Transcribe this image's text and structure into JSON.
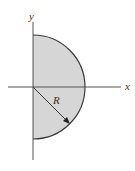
{
  "figure": {
    "labels": {
      "x_axis": "x",
      "y_axis": "y",
      "radius": "R"
    },
    "colors": {
      "fill": "#d6d6d6",
      "stroke": "#3a3a3a",
      "axis": "#555555",
      "background": "#ffffff"
    }
  }
}
